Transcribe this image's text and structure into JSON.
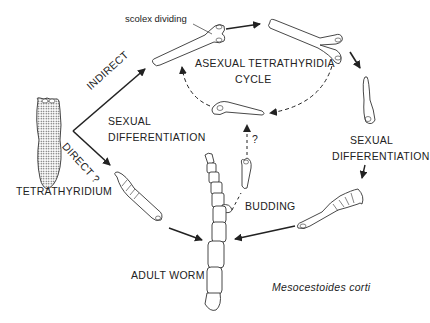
{
  "diagram": {
    "title": "Mesocestoides corti",
    "nodes": {
      "tetrathyridium": "TETRATHYRIDIUM",
      "asexual_cycle_line1": "ASEXUAL TETRATHYRIDIA",
      "asexual_cycle_line2": "CYCLE",
      "scolex_dividing": "scolex dividing",
      "adult_worm": "ADULT WORM"
    },
    "edges": {
      "indirect": "INDIRECT",
      "direct": "DIRECT ?",
      "sexual_diff_left_line1": "SEXUAL",
      "sexual_diff_left_line2": "DIFFERENTIATION",
      "sexual_diff_right_line1": "SEXUAL",
      "sexual_diff_right_line2": "DIFFERENTIATION",
      "budding": "BUDDING",
      "budding_question": "?"
    }
  }
}
